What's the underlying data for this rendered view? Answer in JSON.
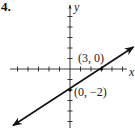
{
  "problem": {
    "number": "4."
  },
  "graph": {
    "axes": {
      "x_label": "x",
      "y_label": "y",
      "x_ticks": [
        -5,
        -4,
        -3,
        -2,
        -1,
        1,
        2,
        3,
        4,
        5
      ],
      "y_ticks": [
        -5,
        -4,
        -3,
        -2,
        -1,
        1,
        2,
        3,
        4,
        5
      ]
    },
    "line": {
      "slope": "2/3",
      "y_intercept": -2,
      "color": "#111111"
    },
    "points": [
      {
        "x": 3,
        "y": 0,
        "label": "(3, 0)"
      },
      {
        "x": 0,
        "y": -2,
        "label": "(0, −2)"
      }
    ],
    "colors": {
      "axis": "#222222",
      "line": "#111111",
      "background": "#ffffff"
    }
  }
}
